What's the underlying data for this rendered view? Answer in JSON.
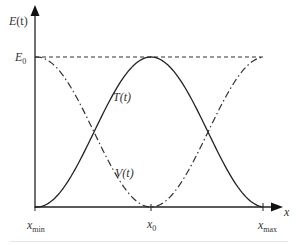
{
  "diagram": {
    "y_axis_label": {
      "main": "E",
      "arg": "(t)"
    },
    "x_axis_label": "x",
    "level_label": {
      "main": "E",
      "sub": "0"
    },
    "curves": [
      {
        "name": "T",
        "label": "T(t)",
        "style": "dash-dot",
        "description": "kinetic energy, E0 - V"
      },
      {
        "name": "V",
        "label": "V(t)",
        "style": "solid",
        "description": "potential energy, E0 at x_min and x_max, 0 at x0"
      },
      {
        "name": "E0",
        "label": "E0",
        "style": "dashed",
        "description": "constant total energy"
      }
    ],
    "x_ticks": [
      {
        "main": "x",
        "sub": "min"
      },
      {
        "main": "x",
        "sub": "0"
      },
      {
        "main": "x",
        "sub": "max"
      }
    ],
    "colors": {
      "line": "#222222",
      "text": "#333333"
    }
  }
}
